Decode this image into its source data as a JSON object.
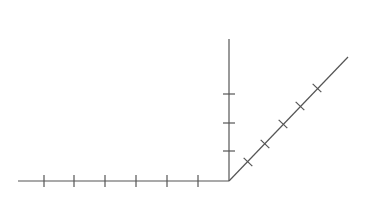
{
  "diagram": {
    "line_color": "#555555",
    "origin": {
      "x": 229,
      "y": 181
    },
    "axes": [
      {
        "name": "x-axis",
        "from": [
          18,
          181
        ],
        "to": [
          229,
          181
        ],
        "ticks": [
          [
            44,
            181
          ],
          [
            74,
            181
          ],
          [
            105,
            181
          ],
          [
            136,
            181
          ],
          [
            167,
            181
          ],
          [
            198,
            181
          ]
        ],
        "tick_orient": "vertical"
      },
      {
        "name": "y-axis",
        "from": [
          229,
          181
        ],
        "to": [
          229,
          39
        ],
        "ticks": [
          [
            229,
            151
          ],
          [
            229,
            123
          ],
          [
            229,
            94
          ]
        ],
        "tick_orient": "horizontal"
      },
      {
        "name": "z-axis",
        "from": [
          229,
          181
        ],
        "to": [
          348,
          57
        ],
        "ticks": [
          [
            248,
            162
          ],
          [
            265,
            144
          ],
          [
            283,
            124
          ],
          [
            300,
            106
          ],
          [
            317,
            88
          ]
        ],
        "tick_orient": "perpendicular"
      }
    ]
  }
}
